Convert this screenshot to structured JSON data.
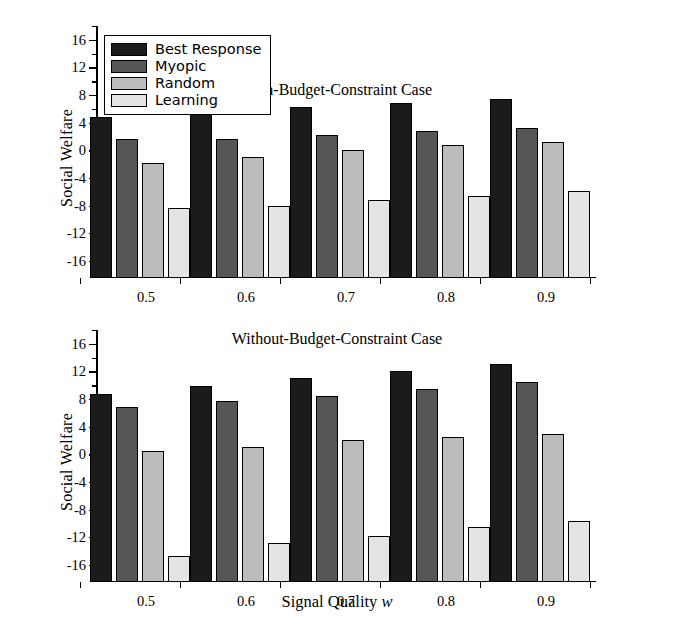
{
  "axes": {
    "ylabel": "Social Welfare",
    "xlabel_prefix": "Signal Quality ",
    "xlabel_symbol": "w",
    "yticks": [
      16,
      12,
      8,
      4,
      0,
      -4,
      -8,
      -12,
      -16
    ],
    "ylim": [
      -18.5,
      18.0
    ],
    "xticks": [
      "0.5",
      "0.6",
      "0.7",
      "0.8",
      "0.9"
    ]
  },
  "legend": {
    "items": [
      {
        "label": "Best Response",
        "color": "#1b1b1b"
      },
      {
        "label": "Myopic",
        "color": "#565656"
      },
      {
        "label": "Random",
        "color": "#bcbcbc"
      },
      {
        "label": "Learning",
        "color": "#e4e4e4"
      }
    ]
  },
  "chart_data": [
    {
      "type": "bar",
      "title": "With-Budget-Constraint Case",
      "xlabel": "Signal Quality w",
      "ylabel": "Social Welfare",
      "categories": [
        "0.5",
        "0.6",
        "0.7",
        "0.8",
        "0.9"
      ],
      "ylim": [
        -18.5,
        18.0
      ],
      "yticks": [
        16,
        12,
        8,
        4,
        0,
        -4,
        -8,
        -12,
        -16
      ],
      "grid": false,
      "legend_position": "upper-left",
      "series": [
        {
          "name": "Best Response",
          "values": [
            4.8,
            5.4,
            6.3,
            6.9,
            7.5
          ]
        },
        {
          "name": "Myopic",
          "values": [
            1.6,
            1.7,
            2.2,
            2.8,
            3.2
          ]
        },
        {
          "name": "Random",
          "values": [
            -1.9,
            -0.9,
            0.0,
            0.7,
            1.2
          ]
        },
        {
          "name": "Learning",
          "values": [
            -8.3,
            -8.0,
            -7.2,
            -6.6,
            -5.9
          ]
        }
      ]
    },
    {
      "type": "bar",
      "title": "Without-Budget-Constraint Case",
      "xlabel": "Signal Quality w",
      "ylabel": "Social Welfare",
      "categories": [
        "0.5",
        "0.6",
        "0.7",
        "0.8",
        "0.9"
      ],
      "ylim": [
        -18.5,
        18.0
      ],
      "yticks": [
        16,
        12,
        8,
        4,
        0,
        -4,
        -8,
        -12,
        -16
      ],
      "grid": false,
      "legend_position": "none",
      "series": [
        {
          "name": "Best Response",
          "values": [
            8.8,
            9.9,
            11.1,
            12.1,
            13.1
          ]
        },
        {
          "name": "Myopic",
          "values": [
            6.8,
            7.7,
            8.4,
            9.5,
            10.5
          ]
        },
        {
          "name": "Random",
          "values": [
            0.5,
            1.1,
            2.0,
            2.5,
            2.9
          ]
        },
        {
          "name": "Learning",
          "values": [
            -14.8,
            -12.8,
            -11.8,
            -10.5,
            -9.6
          ]
        }
      ]
    }
  ]
}
